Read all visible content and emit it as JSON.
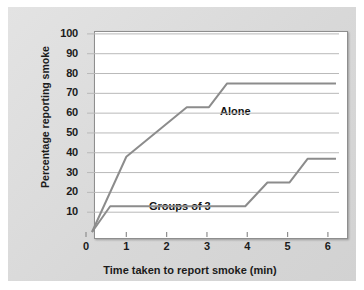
{
  "chart_data": {
    "type": "line",
    "title": "",
    "subtitle": "",
    "xlabel": "Time taken to report smoke (min)",
    "ylabel": "Percentage reporting smoke",
    "xlim": [
      0,
      6.3
    ],
    "ylim": [
      0,
      105
    ],
    "grid": "horizontal",
    "legend_position": "inline-annotation",
    "xticks": [
      "0",
      "1",
      "2",
      "3",
      "4",
      "5",
      "6"
    ],
    "xtick_values": [
      0,
      1,
      2,
      3,
      4,
      5,
      6
    ],
    "yticks": [
      "10",
      "20",
      "30",
      "40",
      "50",
      "60",
      "70",
      "80",
      "90",
      "100"
    ],
    "ytick_values": [
      10,
      20,
      30,
      40,
      50,
      60,
      70,
      80,
      90,
      100
    ],
    "line_color": "#8c8c8c",
    "series": [
      {
        "name": "Alone",
        "label": "Alone",
        "points": [
          [
            0.15,
            0
          ],
          [
            1.0,
            38
          ],
          [
            2.5,
            63
          ],
          [
            3.05,
            63
          ],
          [
            3.5,
            75
          ],
          [
            6.2,
            75
          ]
        ]
      },
      {
        "name": "Groups of 3",
        "label": "Groups of 3",
        "points": [
          [
            0.15,
            0
          ],
          [
            0.6,
            13
          ],
          [
            3.95,
            13
          ],
          [
            4.5,
            25
          ],
          [
            5.05,
            25
          ],
          [
            5.5,
            37
          ],
          [
            6.2,
            37
          ]
        ]
      }
    ],
    "annotations": [
      {
        "text": "Alone",
        "x": 3.55,
        "y": 68
      },
      {
        "text": "Groups of 3",
        "x": 1.45,
        "y": 18
      }
    ]
  },
  "colors": {
    "panel_background": "#dcdcdc",
    "plot_background": "#ffffff",
    "gridline": "#b9b9b9",
    "axis": "#8e8e8e",
    "text": "#1b1b1b",
    "series_line": "#8c8c8c"
  }
}
